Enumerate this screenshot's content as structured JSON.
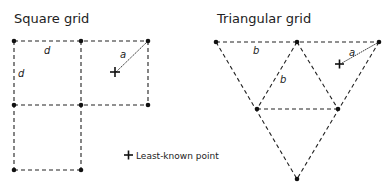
{
  "square_grid": {
    "title": "Square grid",
    "labels": {
      "d_horizontal": "d",
      "d_vertical": "d",
      "a": "a"
    }
  },
  "triangular_grid": {
    "title": "Triangular grid",
    "labels": {
      "b_horizontal": "b",
      "b_diagonal": "b",
      "a": "a"
    }
  },
  "legend": {
    "symbol": "+",
    "label": "Least-known point"
  }
}
